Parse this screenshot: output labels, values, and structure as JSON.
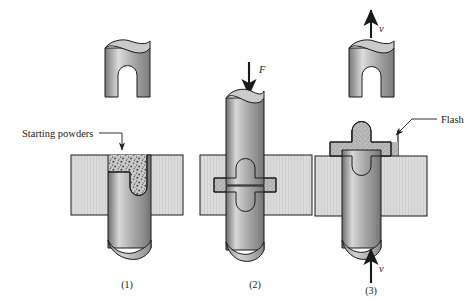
{
  "figure": {
    "kind": "technical-process-diagram",
    "background_color": "#ffffff",
    "ink_color": "#1a1a1a"
  },
  "callouts": {
    "starting_powders": "Starting powders",
    "flash": "Flash"
  },
  "force_labels": {
    "press_force": "F",
    "eject_velocity": "v",
    "upper_velocity": "v"
  },
  "step_captions": {
    "one": "(1)",
    "two": "(2)",
    "three": "(3)"
  },
  "colors": {
    "die_fill": "#d9d9d9",
    "die_stroke": "#1a1a1a",
    "powder_fill": "#b9b9b9",
    "powder_speckle": "#4a4a4a",
    "punch_light": "#e2e2e2",
    "punch_mid": "#a8a8a8",
    "punch_dark": "#6e6e6e",
    "outline": "#1a1a1a"
  },
  "geometry": {
    "canvas_width": 476,
    "canvas_height": 298,
    "step_centers_x": [
      127,
      255,
      370
    ],
    "die_top_y": 155,
    "die_bottom_y": 215
  },
  "parts": {
    "preform_top_left": "notched cylindrical part",
    "finished_part_top_right": "notched cylindrical forged part",
    "die_blocks": "split die halves",
    "punch": "lower punch",
    "upper_punch": "upper punch"
  }
}
